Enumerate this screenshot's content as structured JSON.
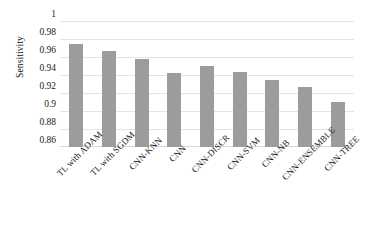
{
  "chart_data": {
    "type": "bar",
    "title": "",
    "xlabel": "",
    "ylabel": "Sensitivity",
    "categories": [
      "TL with ADAM",
      "TL with SGDM",
      "CNN-KNN",
      "CNN",
      "CNN-DISCR",
      "CNN-SVM",
      "CNN-NB",
      "CNN-ENSEMBLE",
      "CNN-TREE"
    ],
    "values": [
      0.975,
      0.967,
      0.958,
      0.942,
      0.95,
      0.943,
      0.935,
      0.927,
      0.91
    ],
    "ylim": [
      0.86,
      1
    ],
    "yticks": [
      "1",
      "0.98",
      "0.96",
      "0.94",
      "0.92",
      "0.9",
      "0.88",
      "0.86"
    ],
    "ytick_values": [
      1,
      0.98,
      0.96,
      0.94,
      0.92,
      0.9,
      0.88,
      0.86
    ],
    "grid": true,
    "legend": "none",
    "bar_color": "#9c9c9c",
    "grid_color": "#e3e3e3",
    "background": "#ffffff"
  }
}
